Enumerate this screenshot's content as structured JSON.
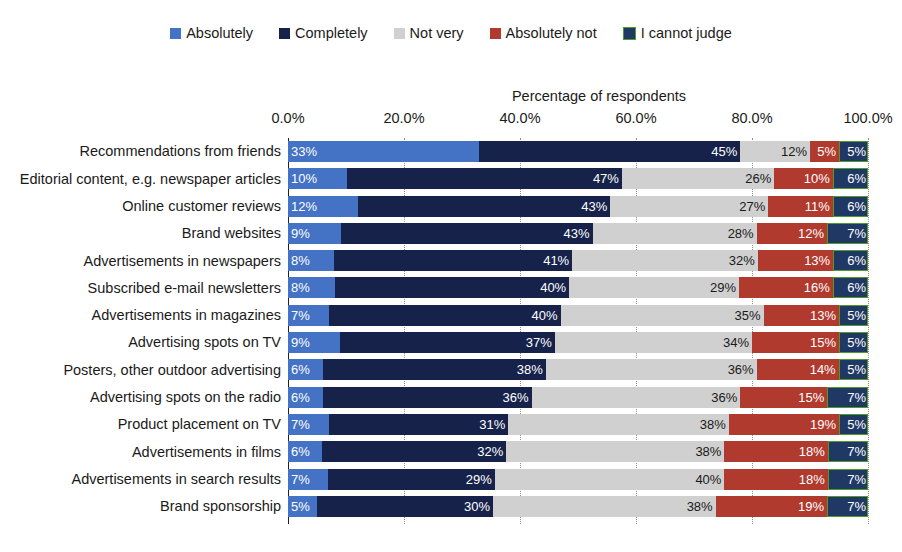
{
  "legend": {
    "items": [
      {
        "label": "Absolutely",
        "color": "#4472C4",
        "border": null
      },
      {
        "label": "Completely",
        "color": "#16224A",
        "border": null
      },
      {
        "label": "Not very",
        "color": "#D0D0D0",
        "border": null
      },
      {
        "label": "Absolutely not",
        "color": "#B03A2E",
        "border": null
      },
      {
        "label": "I cannot judge",
        "color": "#1F3864",
        "border": "#4E9B28"
      }
    ]
  },
  "chart_data": {
    "type": "bar",
    "orientation": "horizontal",
    "stacked": true,
    "stack_mode": "percent",
    "title": "",
    "xlabel": "Percentage of respondents",
    "ylabel": "",
    "xlim": [
      0,
      100
    ],
    "xticks": [
      "0.0%",
      "20.0%",
      "40.0%",
      "60.0%",
      "80.0%",
      "100.0%"
    ],
    "xtick_values": [
      0,
      20,
      40,
      60,
      80,
      100
    ],
    "grid": true,
    "legend_position": "top",
    "categories": [
      "Recommendations from friends",
      "Editorial content, e.g. newspaper articles",
      "Online customer reviews",
      "Brand websites",
      "Advertisements in newspapers",
      "Subscribed e-mail newsletters",
      "Advertisements in magazines",
      "Advertising spots on TV",
      "Posters, other outdoor advertising",
      "Advertising spots on the radio",
      "Product placement on TV",
      "Advertisements in films",
      "Advertisements in search results",
      "Brand sponsorship"
    ],
    "series": [
      {
        "name": "Absolutely",
        "color": "#4472C4",
        "values": [
          33,
          10,
          12,
          9,
          8,
          8,
          7,
          9,
          6,
          6,
          7,
          6,
          7,
          5
        ]
      },
      {
        "name": "Completely",
        "color": "#16224A",
        "values": [
          45,
          47,
          43,
          43,
          41,
          40,
          40,
          37,
          38,
          36,
          31,
          32,
          29,
          30
        ]
      },
      {
        "name": "Not very",
        "color": "#D0D0D0",
        "values": [
          12,
          26,
          27,
          28,
          32,
          29,
          35,
          34,
          36,
          36,
          38,
          38,
          40,
          38
        ]
      },
      {
        "name": "Absolutely not",
        "color": "#B03A2E",
        "values": [
          5,
          10,
          11,
          12,
          13,
          16,
          13,
          15,
          14,
          15,
          19,
          18,
          18,
          19
        ]
      },
      {
        "name": "I cannot judge",
        "color": "#1F3864",
        "values": [
          5,
          6,
          6,
          7,
          6,
          6,
          5,
          5,
          5,
          7,
          5,
          7,
          7,
          7
        ]
      }
    ],
    "labels": [
      [
        "33%",
        "45%",
        "12%",
        "5%",
        "5%"
      ],
      [
        "10%",
        "47%",
        "26%",
        "10%",
        "6%"
      ],
      [
        "12%",
        "43%",
        "27%",
        "11%",
        "6%"
      ],
      [
        "9%",
        "43%",
        "28%",
        "12%",
        "7%"
      ],
      [
        "8%",
        "41%",
        "32%",
        "13%",
        "6%"
      ],
      [
        "8%",
        "40%",
        "29%",
        "16%",
        "6%"
      ],
      [
        "7%",
        "40%",
        "35%",
        "13%",
        "5%"
      ],
      [
        "9%",
        "37%",
        "34%",
        "15%",
        "5%"
      ],
      [
        "6%",
        "38%",
        "36%",
        "14%",
        "5%"
      ],
      [
        "6%",
        "36%",
        "36%",
        "15%",
        "7%"
      ],
      [
        "7%",
        "31%",
        "38%",
        "19%",
        "5%"
      ],
      [
        "6%",
        "32%",
        "38%",
        "18%",
        "7%"
      ],
      [
        "7%",
        "29%",
        "40%",
        "18%",
        "7%"
      ],
      [
        "5%",
        "30%",
        "38%",
        "19%",
        "7%"
      ]
    ]
  }
}
